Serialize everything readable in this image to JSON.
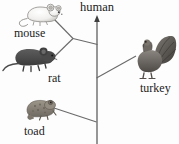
{
  "figure": {
    "type": "phylogenetic-tree",
    "background_color": "#fdfdfd",
    "line_color": "#4a4a4a",
    "text_color": "#1b1b1b"
  },
  "labels": {
    "human": "human",
    "mouse": "mouse",
    "rat": "rat",
    "toad": "toad",
    "turkey": "turkey"
  },
  "organisms": [
    {
      "name": "mouse",
      "icon": "mouse-illustration",
      "color": "#e8e8e8"
    },
    {
      "name": "rat",
      "icon": "rat-illustration",
      "color": "#4d4d4d"
    },
    {
      "name": "toad",
      "icon": "toad-illustration",
      "color": "#8a8378"
    },
    {
      "name": "turkey",
      "icon": "turkey-illustration",
      "color": "#6f6a64"
    }
  ],
  "tree": {
    "trunk": {
      "x": 97,
      "top_y": 18,
      "bottom_y": 144,
      "arrow": "up"
    },
    "nodes": [
      {
        "id": "rodent-node",
        "x": 73,
        "y": 38
      },
      {
        "id": "trunk-rodent-join",
        "x": 97,
        "y": 44
      },
      {
        "id": "trunk-turkey-join",
        "x": 97,
        "y": 78
      },
      {
        "id": "trunk-toad-join",
        "x": 97,
        "y": 122
      }
    ],
    "branches": [
      {
        "from": "mouse",
        "x1": 52,
        "y1": 18,
        "x2": 73,
        "y2": 38
      },
      {
        "from": "rat",
        "x1": 52,
        "y1": 59,
        "x2": 73,
        "y2": 38
      },
      {
        "from": "rodent-node",
        "x1": 73,
        "y1": 38,
        "x2": 97,
        "y2": 44
      },
      {
        "from": "turkey",
        "x1": 135,
        "y1": 57,
        "x2": 97,
        "y2": 78
      },
      {
        "from": "toad",
        "x1": 54,
        "y1": 108,
        "x2": 97,
        "y2": 122
      }
    ]
  }
}
